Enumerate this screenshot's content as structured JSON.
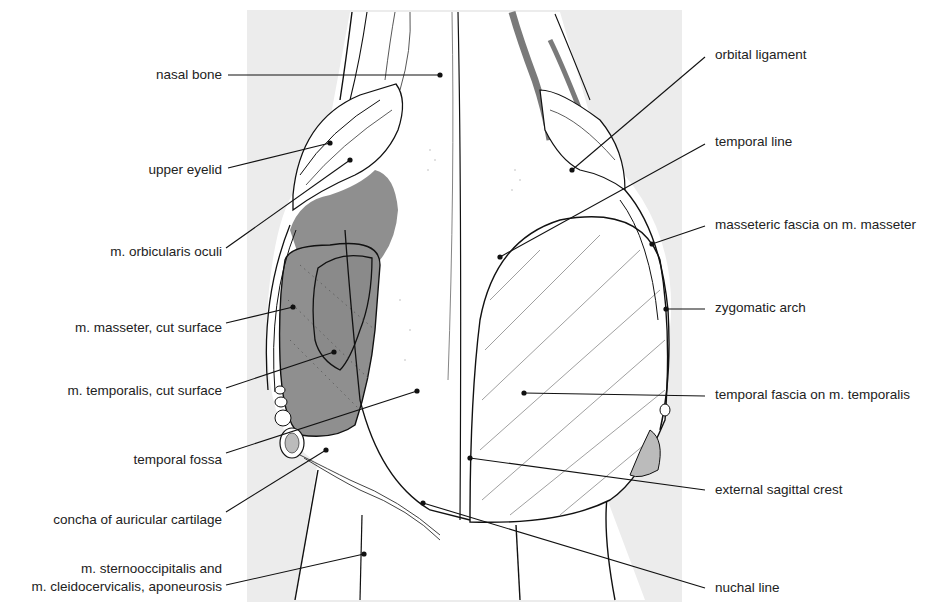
{
  "figure": {
    "background_panel_color": "#ececec",
    "cut_surface_color": "#8f8f8f",
    "vessel_color": "#7a7a7a",
    "line_color": "#111111"
  },
  "labels_left": [
    {
      "id": "nasal-bone",
      "text": "nasal bone",
      "y": 75,
      "line": [
        228,
        75,
        440,
        75
      ]
    },
    {
      "id": "upper-eyelid",
      "text": "upper eyelid",
      "y": 170,
      "line": [
        228,
        168,
        330,
        143
      ]
    },
    {
      "id": "orbicularis-oculi",
      "text": "m. orbicularis oculi",
      "y": 252,
      "line": [
        226,
        248,
        350,
        160
      ]
    },
    {
      "id": "masseter-cut",
      "text": "m. masseter, cut surface",
      "y": 328,
      "line": [
        226,
        323,
        293,
        307
      ]
    },
    {
      "id": "temporalis-cut",
      "text": "m. temporalis, cut surface",
      "y": 391,
      "line": [
        226,
        388,
        334,
        352
      ]
    },
    {
      "id": "temporal-fossa",
      "text": "temporal fossa",
      "y": 460,
      "line": [
        226,
        453,
        417,
        391
      ]
    },
    {
      "id": "auricular-concha",
      "text": "concha of auricular cartilage",
      "y": 520,
      "line": [
        226,
        512,
        326,
        450
      ]
    },
    {
      "id": "sternooccipitalis",
      "text": "m. sternooccipitalis and",
      "text2": "m. cleidocervicalis, aponeurosis",
      "y": 568,
      "line": [
        226,
        585,
        364,
        554
      ]
    }
  ],
  "labels_right": [
    {
      "id": "orbital-ligament",
      "text": "orbital ligament",
      "y": 55,
      "line": [
        705,
        57,
        572,
        170
      ]
    },
    {
      "id": "temporal-line",
      "text": "temporal line",
      "y": 142,
      "line": [
        705,
        144,
        500,
        257
      ]
    },
    {
      "id": "masseteric-fascia",
      "text": "masseteric fascia on m. masseter",
      "y": 225,
      "line": [
        705,
        226,
        652,
        244
      ]
    },
    {
      "id": "zygomatic-arch",
      "text": "zygomatic arch",
      "y": 308,
      "line": [
        705,
        309,
        666,
        309
      ]
    },
    {
      "id": "temporal-fascia",
      "text": "temporal fascia on m. temporalis",
      "y": 395,
      "line": [
        705,
        396,
        524,
        393
      ]
    },
    {
      "id": "external-sagittal-crest",
      "text": "external sagittal crest",
      "y": 490,
      "line": [
        705,
        490,
        470,
        458
      ]
    },
    {
      "id": "nuchal-line",
      "text": "nuchal line",
      "y": 588,
      "line": [
        705,
        588,
        423,
        503
      ]
    }
  ]
}
